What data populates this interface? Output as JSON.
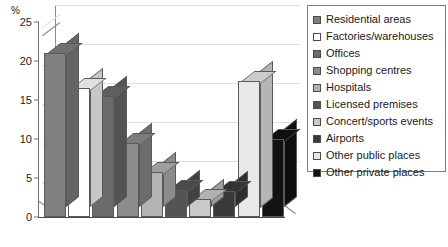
{
  "chart_data": {
    "type": "bar",
    "title": "",
    "subtitle": "",
    "xlabel": "",
    "ylabel": "%",
    "ylim": [
      0,
      25
    ],
    "yticks": [
      0,
      5,
      10,
      15,
      20,
      25
    ],
    "ytick_labels": [
      "0",
      "5",
      "10",
      "15",
      "20",
      "25"
    ],
    "grid": true,
    "legend_position": "right",
    "style": "3d-column",
    "categories": [
      "Residential areas",
      "Factories/warehouses",
      "Offices",
      "Shopping centres",
      "Hospitals",
      "Licensed premises",
      "Concert/sports events",
      "Airports",
      "Other public places",
      "Other private places"
    ],
    "values": [
      21,
      16.5,
      15.5,
      9.5,
      5.8,
      3.5,
      2.3,
      3.3,
      17.5,
      10
    ],
    "colors": [
      "#808080",
      "#ffffff",
      "#6b6b6b",
      "#8c8c8c",
      "#b3b3b3",
      "#545454",
      "#c9c9c9",
      "#3a3a3a",
      "#e8e8e8",
      "#121212"
    ]
  },
  "legend": {
    "items": [
      {
        "label": "Residential areas",
        "color": "#808080"
      },
      {
        "label": "Factories/warehouses",
        "color": "#ffffff"
      },
      {
        "label": "Offices",
        "color": "#6b6b6b"
      },
      {
        "label": "Shopping centres",
        "color": "#8c8c8c"
      },
      {
        "label": "Hospitals",
        "color": "#b3b3b3"
      },
      {
        "label": "Licensed premises",
        "color": "#545454"
      },
      {
        "label": "Concert/sports events",
        "color": "#c9c9c9"
      },
      {
        "label": "Airports",
        "color": "#3a3a3a"
      },
      {
        "label": "Other public places",
        "color": "#e8e8e8"
      },
      {
        "label": "Other private places",
        "color": "#121212"
      }
    ]
  }
}
